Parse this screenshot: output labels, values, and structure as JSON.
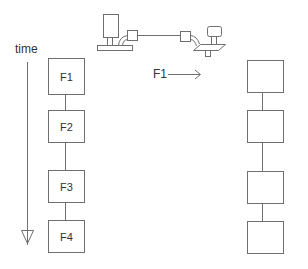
{
  "diagram": {
    "time_axis": {
      "label": "time",
      "direction": "down"
    },
    "transfer_label": "F1",
    "left_column": {
      "frames": [
        {
          "label": "F1"
        },
        {
          "label": "F2"
        },
        {
          "label": "F3"
        },
        {
          "label": "F4"
        }
      ]
    },
    "right_column": {
      "frames": [
        {
          "label": ""
        },
        {
          "label": ""
        },
        {
          "label": ""
        },
        {
          "label": ""
        }
      ]
    },
    "illustration": {
      "description": "two machines connected by a line (sender to receiver)"
    },
    "colors": {
      "stroke": "#6f6f6f",
      "text": "#333333",
      "background": "#ffffff"
    }
  }
}
